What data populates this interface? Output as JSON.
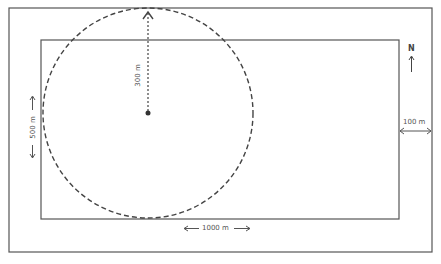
{
  "diagram": {
    "type": "site-plan",
    "outer_rect": {
      "x": 9,
      "y": 8,
      "w": 423,
      "h": 244
    },
    "inner_rect": {
      "x": 41,
      "y": 40,
      "w": 358,
      "h": 179
    },
    "circle": {
      "cx": 148,
      "cy": 113,
      "r": 105,
      "style": "dashed"
    },
    "colors": {
      "line": "#555555",
      "text": "#555555",
      "background": "#ffffff"
    },
    "labels": {
      "radius": "300 m",
      "height": "500 m",
      "width": "1000 m",
      "margin": "100 m",
      "north": "N"
    },
    "width_arrow": {
      "left": "<—",
      "right": "—>"
    },
    "height_arrow": {
      "top": "<",
      "bottom": ">"
    }
  }
}
